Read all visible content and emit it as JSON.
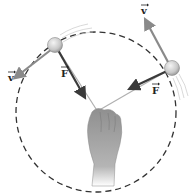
{
  "diagram": {
    "colors": {
      "background": "#ffffff",
      "path": "#333333",
      "velocity_arrow": "#8a8a8a",
      "force_arrow": "#3a3a3a",
      "ball": "#cfcfcf",
      "hand": "#9a9a9a",
      "string": "#b0b0b0"
    },
    "path": {
      "name": "circular path",
      "style": "dashed",
      "cx": 96,
      "cy": 112,
      "r": 80
    },
    "balls": [
      {
        "id": "ball-1",
        "x": 55,
        "y": 45,
        "velocity_label": "v",
        "force_label": "F",
        "velocity_end": [
          14,
          78
        ],
        "force_end": [
          86,
          98
        ],
        "v_label_pos": [
          9,
          80
        ],
        "f_label_pos": [
          61,
          76
        ]
      },
      {
        "id": "ball-2",
        "x": 172,
        "y": 68,
        "velocity_label": "v",
        "force_label": "F",
        "velocity_end": [
          144,
          18
        ],
        "force_end": [
          128,
          90
        ],
        "v_label_pos": [
          142,
          13
        ],
        "f_label_pos": [
          152,
          93
        ]
      }
    ],
    "hand": {
      "x": 97,
      "y": 110
    },
    "labels": {
      "v1": "v",
      "f1": "F",
      "v2": "v",
      "f2": "F"
    }
  }
}
